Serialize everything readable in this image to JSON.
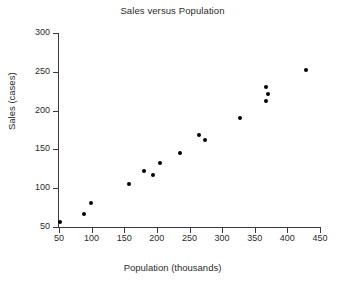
{
  "chart_data": {
    "type": "scatter",
    "title": "Sales versus Population",
    "xlabel": "Population (thousands)",
    "ylabel": "Sales (cases)",
    "xlim": [
      50,
      450
    ],
    "ylim": [
      50,
      300
    ],
    "xticks": [
      50,
      100,
      150,
      200,
      250,
      300,
      350,
      400,
      450
    ],
    "yticks": [
      50,
      100,
      150,
      200,
      250,
      300
    ],
    "grid": false,
    "legend": null,
    "marker": "filled-circle",
    "marker_color": "#000000",
    "points": [
      {
        "x": 52,
        "y": 57
      },
      {
        "x": 88,
        "y": 67
      },
      {
        "x": 99,
        "y": 81
      },
      {
        "x": 157,
        "y": 105
      },
      {
        "x": 181,
        "y": 122
      },
      {
        "x": 194,
        "y": 117
      },
      {
        "x": 205,
        "y": 132
      },
      {
        "x": 235,
        "y": 145
      },
      {
        "x": 265,
        "y": 169
      },
      {
        "x": 274,
        "y": 162
      },
      {
        "x": 328,
        "y": 191
      },
      {
        "x": 368,
        "y": 231
      },
      {
        "x": 371,
        "y": 222
      },
      {
        "x": 368,
        "y": 212
      },
      {
        "x": 428,
        "y": 252
      }
    ]
  }
}
